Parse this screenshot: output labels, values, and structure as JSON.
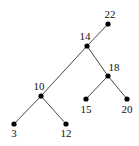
{
  "diagram": {
    "type": "binary-search-tree",
    "root": "22",
    "nodes": [
      {
        "id": "22",
        "label": "22"
      },
      {
        "id": "14",
        "label": "14"
      },
      {
        "id": "18",
        "label": "18"
      },
      {
        "id": "10",
        "label": "10"
      },
      {
        "id": "15",
        "label": "15"
      },
      {
        "id": "20",
        "label": "20"
      },
      {
        "id": "3",
        "label": "3"
      },
      {
        "id": "12",
        "label": "12"
      }
    ],
    "edges": [
      {
        "from": "22",
        "to": "14",
        "side": "left"
      },
      {
        "from": "14",
        "to": "10",
        "side": "left"
      },
      {
        "from": "14",
        "to": "18",
        "side": "right"
      },
      {
        "from": "18",
        "to": "15",
        "side": "left"
      },
      {
        "from": "18",
        "to": "20",
        "side": "right"
      },
      {
        "from": "10",
        "to": "3",
        "side": "left"
      },
      {
        "from": "10",
        "to": "12",
        "side": "right"
      }
    ],
    "colors": {
      "node": "#000000",
      "edge": "#333333",
      "background": "#ffffff"
    }
  }
}
